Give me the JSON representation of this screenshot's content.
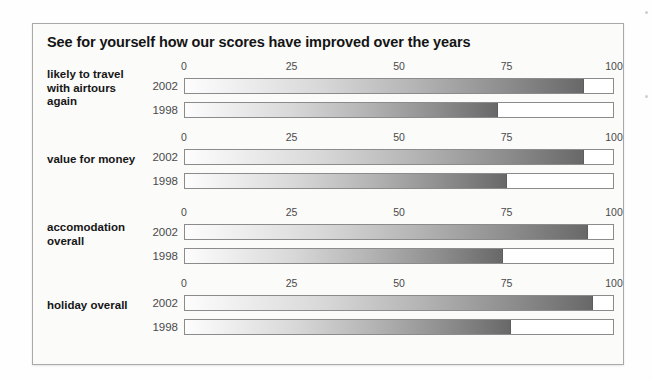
{
  "panel": {
    "title": "See for yourself how our scores have improved over the years"
  },
  "chart_data": {
    "type": "bar",
    "title": "See for yourself how our scores have improved over the years",
    "xlabel": "",
    "ylabel": "",
    "xlim": [
      0,
      100
    ],
    "ticks": [
      "0",
      "25",
      "50",
      "75",
      "100"
    ],
    "tick_values": [
      0,
      25,
      50,
      75,
      100
    ],
    "grid": false,
    "legend": "none",
    "orientation": "horizontal",
    "categories": [
      "likely to travel with airtours again",
      "value for money",
      "accomodation overall",
      "holiday overall"
    ],
    "series": [
      {
        "name": "2002",
        "values": [
          93,
          93,
          94,
          95
        ]
      },
      {
        "name": "1998",
        "values": [
          73,
          75,
          74,
          76
        ]
      }
    ],
    "groups": [
      {
        "label_lines": [
          "likely to travel",
          "with airtours",
          "again"
        ],
        "bars": [
          {
            "year": "2002",
            "value": 93
          },
          {
            "year": "1998",
            "value": 73
          }
        ]
      },
      {
        "label_lines": [
          "value for money"
        ],
        "bars": [
          {
            "year": "2002",
            "value": 93
          },
          {
            "year": "1998",
            "value": 75
          }
        ]
      },
      {
        "label_lines": [
          "accomodation",
          "overall"
        ],
        "bars": [
          {
            "year": "2002",
            "value": 94
          },
          {
            "year": "1998",
            "value": 74
          }
        ]
      },
      {
        "label_lines": [
          "holiday overall"
        ],
        "bars": [
          {
            "year": "2002",
            "value": 95
          },
          {
            "year": "1998",
            "value": 76
          }
        ]
      }
    ]
  },
  "colors": {
    "panel_background": "#fbfbfa",
    "panel_border": "#a9a9a9",
    "title_text": "#141414",
    "label_text": "#161616",
    "tick_text": "#4a4a4a",
    "bar_track": "#ffffff",
    "bar_border": "#8b8b8b",
    "bar_fill_light": "#fdfdfd",
    "bar_fill_dark": "#686868"
  }
}
